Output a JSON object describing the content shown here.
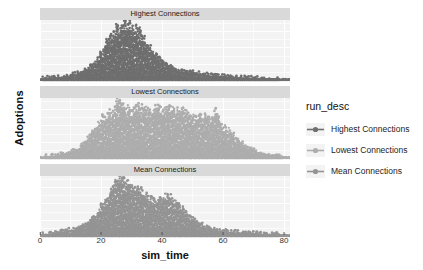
{
  "chart_data": {
    "type": "scatter",
    "title": "",
    "xlabel": "sim_time",
    "ylabel": "Adoptions",
    "xlim": [
      0,
      82
    ],
    "ylim": [
      -3,
      92
    ],
    "xticks": [
      0,
      20,
      40,
      60,
      80
    ],
    "yticks": [
      0,
      25,
      50,
      75
    ],
    "grid": true,
    "legend": {
      "title": "run_desc",
      "position": "right",
      "entries": [
        {
          "label": "Highest Connections",
          "color": "#6f6f6f"
        },
        {
          "label": "Lowest Connections",
          "color": "#adadad"
        },
        {
          "label": "Mean Connections",
          "color": "#949494"
        }
      ]
    },
    "facets": [
      {
        "label": "Highest Connections",
        "color": "#6f6f6f",
        "description": "Right-skewed unimodal cloud rising from 0 at sim_time 0, shoulder near 22, peak about 80 at sim_time 25-30, long tail decaying to 0 by sim_time 80",
        "peak_x": 27,
        "peak_y": 82,
        "profile_x": [
          0,
          4,
          8,
          12,
          15,
          18,
          20,
          22,
          24,
          26,
          28,
          30,
          32,
          34,
          36,
          38,
          40,
          44,
          48,
          52,
          56,
          60,
          64,
          68,
          72,
          76,
          80
        ],
        "profile_y": [
          0,
          2,
          4,
          8,
          14,
          24,
          38,
          55,
          68,
          78,
          82,
          80,
          74,
          62,
          48,
          36,
          27,
          16,
          11,
          8,
          6,
          4,
          3,
          2,
          1,
          1,
          0
        ]
      },
      {
        "label": "Lowest Connections",
        "color": "#adadad",
        "description": "Broad plateau near 70 from sim_time 22 to 48 with a spike to 88 at 26, ragged decline after 50 with outlier clusters near 55-65, reaching 0 by 80",
        "peak_x": 26,
        "peak_y": 88,
        "profile_x": [
          0,
          4,
          8,
          12,
          14,
          16,
          18,
          20,
          22,
          24,
          26,
          28,
          30,
          34,
          38,
          42,
          46,
          48,
          50,
          52,
          54,
          56,
          58,
          60,
          62,
          64,
          68,
          72,
          76,
          80
        ],
        "profile_y": [
          0,
          1,
          4,
          10,
          18,
          30,
          42,
          55,
          64,
          70,
          88,
          72,
          73,
          72,
          71,
          70,
          68,
          66,
          62,
          58,
          64,
          55,
          68,
          46,
          40,
          28,
          14,
          7,
          3,
          0
        ]
      },
      {
        "label": "Mean Connections",
        "color": "#949494",
        "description": "Unimodal cloud peaking about 85 near sim_time 26, secondary lobe of points near 42-46 around 60, tail decaying to 0 by sim_time 80",
        "peak_x": 26,
        "peak_y": 85,
        "profile_x": [
          0,
          4,
          8,
          12,
          15,
          18,
          20,
          22,
          24,
          26,
          28,
          30,
          32,
          34,
          36,
          38,
          40,
          42,
          44,
          46,
          48,
          52,
          56,
          60,
          64,
          68,
          72,
          76,
          80
        ],
        "profile_y": [
          0,
          2,
          5,
          10,
          16,
          26,
          40,
          56,
          72,
          85,
          80,
          74,
          68,
          62,
          55,
          50,
          52,
          58,
          54,
          42,
          30,
          18,
          10,
          6,
          4,
          3,
          2,
          1,
          0
        ]
      }
    ]
  }
}
